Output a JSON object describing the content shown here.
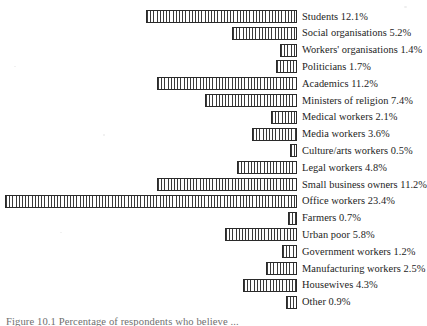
{
  "chart_data": {
    "type": "bar",
    "orientation": "horizontal",
    "title": "",
    "xlabel": "",
    "ylabel": "",
    "grid": false,
    "legend": "none",
    "bars_aligned": "right",
    "axis_unit": "%",
    "xlim": [
      0,
      23.4
    ],
    "categories": [
      "Students",
      "Social organisations",
      "Workers' organisations",
      "Politicians",
      "Academics",
      "Ministers of religion",
      "Medical workers",
      "Media workers",
      "Culture/arts workers",
      "Legal workers",
      "Small business owners",
      "Office workers",
      "Farmers",
      "Urban poor",
      "Government workers",
      "Manufacturing workers",
      "Housewives",
      "Other"
    ],
    "values": [
      12.1,
      5.2,
      1.4,
      1.7,
      11.2,
      7.4,
      2.1,
      3.6,
      0.5,
      4.8,
      11.2,
      23.4,
      0.7,
      5.8,
      1.2,
      2.5,
      4.3,
      0.9
    ],
    "labels": [
      "Students 12.1%",
      "Social organisations 5.2%",
      "Workers' organisations 1.4%",
      "Politicians 1.7%",
      "Academics 11.2%",
      "Ministers of religion 7.4%",
      "Medical workers 2.1%",
      "Media workers 3.6%",
      "Culture/arts workers 0.5%",
      "Legal workers 4.8%",
      "Small business owners 11.2%",
      "Office workers 23.4%",
      "Farmers 0.7%",
      "Urban poor 5.8%",
      "Government workers 1.2%",
      "Manufacturing workers 2.5%",
      "Housewives 4.3%",
      "Other 0.9%"
    ],
    "colors": {
      "bar_fill": "#cfcfcf",
      "bar_hatch": "#3a3a3a",
      "bar_border": "#2a2a2a",
      "text": "#1d1d1d",
      "background": "#ffffff"
    }
  },
  "caption": {
    "text": "Figure 10.1  Percentage of respondents who believe ..."
  }
}
